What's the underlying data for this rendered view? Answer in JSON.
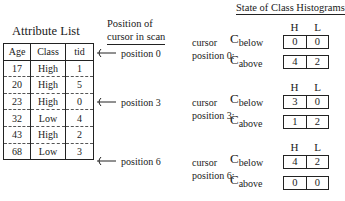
{
  "attribute_list": {
    "title": "Attribute List",
    "columns": [
      "Age",
      "Class",
      "tid"
    ],
    "rows": [
      {
        "age": "17",
        "class": "High",
        "tid": "1"
      },
      {
        "age": "20",
        "class": "High",
        "tid": "5"
      },
      {
        "age": "23",
        "class": "High",
        "tid": "0"
      },
      {
        "age": "32",
        "class": "Low",
        "tid": "4"
      },
      {
        "age": "43",
        "class": "High",
        "tid": "2"
      },
      {
        "age": "68",
        "class": "Low",
        "tid": "3"
      }
    ]
  },
  "cursor_column": {
    "title_line1": "Position of",
    "title_line2": "cursor in scan",
    "markers": [
      {
        "label": "position 0"
      },
      {
        "label": "position 3"
      },
      {
        "label": "position 6"
      }
    ]
  },
  "histograms": {
    "title": "State of Class Histograms",
    "headers": [
      "H",
      "L"
    ],
    "row_labels": {
      "below_main": "C",
      "below_sub": "below",
      "above_main": "C",
      "above_sub": "above"
    },
    "states": [
      {
        "cursor_line1": "cursor",
        "cursor_line2": "position 0:",
        "below": [
          "0",
          "0"
        ],
        "above": [
          "4",
          "2"
        ]
      },
      {
        "cursor_line1": "cursor",
        "cursor_line2": "position 3:",
        "below": [
          "3",
          "0"
        ],
        "above": [
          "1",
          "2"
        ]
      },
      {
        "cursor_line1": "cursor",
        "cursor_line2": "position 6:",
        "below": [
          "4",
          "2"
        ],
        "above": [
          "0",
          "0"
        ]
      }
    ]
  }
}
